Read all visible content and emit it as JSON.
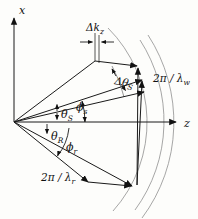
{
  "figure": {
    "kind": "wave-vector k-space diagram",
    "colors": {
      "line": "#1a1a1a",
      "arc": "#8f8f8f",
      "background": "#fdfdfb"
    }
  },
  "labels": {
    "x_axis": "x",
    "z_axis": "z",
    "delta_kz": {
      "main": "Δk",
      "sub": "z"
    },
    "delta_theta_s": {
      "main": "Δθ",
      "sub": "S"
    },
    "theta_s": {
      "main": "θ",
      "sub": "S"
    },
    "phi_s": {
      "main": "ϕ",
      "sub": "s"
    },
    "theta_r": {
      "main": "θ",
      "sub": "R"
    },
    "phi_r": {
      "main": "ϕ",
      "sub": "r"
    },
    "two_pi_lambda_w": {
      "main": "2π / λ",
      "sub": "w"
    },
    "two_pi_lambda_r": {
      "main": "2π / λ",
      "sub": "r"
    }
  }
}
